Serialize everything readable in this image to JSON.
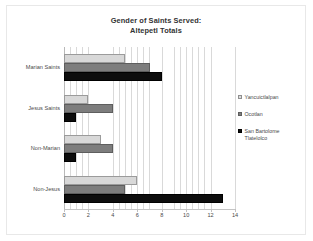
{
  "chart_data": {
    "type": "bar",
    "orientation": "horizontal",
    "title": "Gender of Saints Served: Altepetl Totals",
    "title_lines": [
      "Gender of Saints Served:",
      "Altepetl Totals"
    ],
    "xlabel": "",
    "ylabel": "",
    "xlim": [
      0,
      14
    ],
    "xticks": [
      0,
      2,
      4,
      6,
      8,
      10,
      12,
      14
    ],
    "xtick_labels": [
      "0",
      "2",
      "4",
      "6",
      "8",
      "10",
      "12",
      "14"
    ],
    "grid": "vertical-minor-and-major",
    "legend_position": "right",
    "categories": [
      "Marian Saints",
      "Jesus Saints",
      "Non-Marian",
      "Non-Jesus"
    ],
    "series": [
      {
        "name": "Yancuictlalpan",
        "color": "#d8d8d8",
        "values": [
          5,
          2,
          3,
          6
        ]
      },
      {
        "name": "Ocotlan",
        "color": "#7d7d7d",
        "values": [
          7,
          4,
          4,
          5
        ]
      },
      {
        "name": "San Bartolome Tlatelolco",
        "color": "#0d0d0d",
        "values": [
          8,
          1,
          1,
          13
        ]
      }
    ]
  },
  "legend": {
    "items": [
      {
        "label": "Yancuictlalpan",
        "label_lines": [
          "Yancuictlalpan"
        ]
      },
      {
        "label": "Ocotlan",
        "label_lines": [
          "Ocotlan"
        ]
      },
      {
        "label": "San Bartolome Tlatelolco",
        "label_lines": [
          "San Bartolome",
          "Tlatelolco"
        ]
      }
    ]
  },
  "colors": {
    "series_light": "#d8d8d8",
    "series_medium": "#7d7d7d",
    "series_dark": "#0d0d0d",
    "gridline": "#d9d9d9",
    "axis": "#b9b9b9",
    "text": "#4a4a4a",
    "title_text": "#333333",
    "frame_border": "#e8e8e8",
    "background": "#ffffff"
  }
}
